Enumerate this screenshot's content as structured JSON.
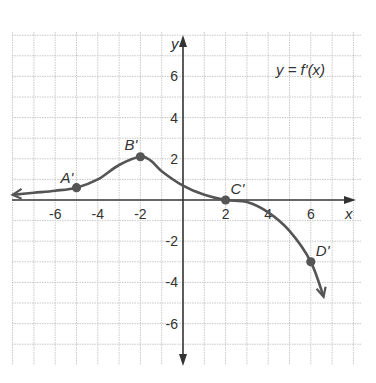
{
  "chart_data": {
    "type": "line",
    "title": "y = f'(x)",
    "xlabel": "x",
    "ylabel": "y",
    "xlim": [
      -8,
      8
    ],
    "ylim": [
      -7.5,
      7.5
    ],
    "grid": true,
    "x_ticks": [
      -6,
      -4,
      -2,
      2,
      4,
      6
    ],
    "y_ticks": [
      6,
      4,
      2,
      -2,
      -4,
      -6
    ],
    "x_tick_labels": [
      "-6",
      "-4",
      "-2",
      "2",
      "4",
      "6"
    ],
    "y_tick_labels": [
      "6",
      "4",
      "2",
      "-2",
      "-4",
      "-6"
    ],
    "series": [
      {
        "name": "f'(x)",
        "color": "#555555",
        "points": [
          [
            -8.0,
            0.25
          ],
          [
            -7,
            0.35
          ],
          [
            -6,
            0.45
          ],
          [
            -5,
            0.6
          ],
          [
            -4,
            1.0
          ],
          [
            -3,
            1.7
          ],
          [
            -2,
            2.1
          ],
          [
            -1.5,
            1.9
          ],
          [
            -1,
            1.4
          ],
          [
            0,
            0.7
          ],
          [
            1,
            0.25
          ],
          [
            2,
            0.0
          ],
          [
            3,
            -0.1
          ],
          [
            4,
            -0.6
          ],
          [
            5,
            -1.5
          ],
          [
            6,
            -3.0
          ],
          [
            6.6,
            -4.7
          ]
        ],
        "arrow_start": true,
        "arrow_end": true
      }
    ],
    "annotations": [
      {
        "label": "A'",
        "x": -5,
        "y": 0.6
      },
      {
        "label": "B'",
        "x": -2,
        "y": 2.1
      },
      {
        "label": "C'",
        "x": 2,
        "y": 0
      },
      {
        "label": "D'",
        "x": 6,
        "y": -3
      }
    ],
    "legend": "top-right"
  }
}
